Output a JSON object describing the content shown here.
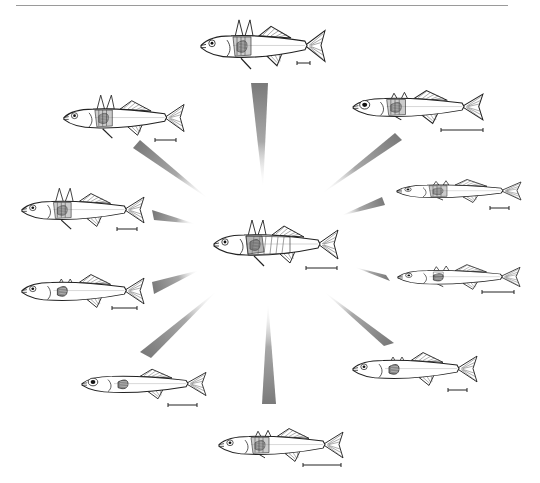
{
  "figure": {
    "type": "adaptive-radiation-diagram",
    "top_rule_color": "#9a9a9a",
    "wedge_color": "#7a7a7a",
    "line_color": "#222222"
  },
  "ancestor": {
    "name": "central-ancestral-fish",
    "x": 210,
    "y": 222,
    "w": 130,
    "h": 45,
    "spines": "long",
    "armor": "full",
    "eye": "small",
    "scale_bar": {
      "x1": 306,
      "x2": 337,
      "y": 268
    }
  },
  "fish": [
    {
      "name": "fish-top",
      "x": 197,
      "y": 22,
      "w": 130,
      "h": 48,
      "spines": "long",
      "armor": "partial",
      "eye": "small",
      "scale_bar": {
        "x1": 297,
        "x2": 310,
        "y": 63
      }
    },
    {
      "name": "fish-upper-left",
      "x": 60,
      "y": 97,
      "w": 126,
      "h": 42,
      "spines": "long",
      "armor": "partial",
      "eye": "small",
      "scale_bar": {
        "x1": 155,
        "x2": 176,
        "y": 140
      }
    },
    {
      "name": "fish-upper-right",
      "x": 349,
      "y": 87,
      "w": 136,
      "h": 40,
      "spines": "short",
      "armor": "partial",
      "eye": "large",
      "scale_bar": {
        "x1": 441,
        "x2": 483,
        "y": 130
      }
    },
    {
      "name": "fish-mid-left",
      "x": 18,
      "y": 190,
      "w": 128,
      "h": 40,
      "spines": "long",
      "armor": "partial",
      "eye": "small",
      "scale_bar": {
        "x1": 117,
        "x2": 137,
        "y": 229
      }
    },
    {
      "name": "fish-mid-right",
      "x": 393,
      "y": 177,
      "w": 130,
      "h": 28,
      "spines": "short",
      "armor": "partial",
      "eye": "small",
      "scale_bar": {
        "x1": 490,
        "x2": 509,
        "y": 208
      }
    },
    {
      "name": "fish-lower-left",
      "x": 18,
      "y": 271,
      "w": 128,
      "h": 40,
      "spines": "tiny",
      "armor": "none",
      "eye": "small",
      "scale_bar": {
        "x1": 112,
        "x2": 137,
        "y": 308
      }
    },
    {
      "name": "fish-lower-right",
      "x": 394,
      "y": 262,
      "w": 128,
      "h": 30,
      "spines": "short",
      "armor": "low",
      "eye": "small",
      "scale_bar": {
        "x1": 482,
        "x2": 514,
        "y": 292
      }
    },
    {
      "name": "fish-bottom-left",
      "x": 78,
      "y": 366,
      "w": 130,
      "h": 36,
      "spines": "none",
      "armor": "none",
      "eye": "large",
      "scale_bar": {
        "x1": 168,
        "x2": 197,
        "y": 405
      }
    },
    {
      "name": "fish-bottom-right",
      "x": 349,
      "y": 349,
      "w": 130,
      "h": 40,
      "spines": "tiny",
      "armor": "none",
      "eye": "small",
      "scale_bar": {
        "x1": 448,
        "x2": 467,
        "y": 390
      }
    },
    {
      "name": "fish-bottom",
      "x": 215,
      "y": 425,
      "w": 130,
      "h": 40,
      "spines": "short",
      "armor": "partial",
      "eye": "small",
      "scale_bar": {
        "x1": 303,
        "x2": 341,
        "y": 465
      }
    }
  ],
  "wedges": [
    {
      "name": "wedge-top",
      "tip": [
        263,
        190
      ],
      "base": [
        [
          251,
          83
        ],
        [
          268,
          83
        ]
      ]
    },
    {
      "name": "wedge-upper-left",
      "tip": [
        210,
        200
      ],
      "base": [
        [
          133,
          148
        ],
        [
          140,
          140
        ]
      ]
    },
    {
      "name": "wedge-upper-right",
      "tip": [
        320,
        195
      ],
      "base": [
        [
          395,
          133
        ],
        [
          402,
          140
        ]
      ]
    },
    {
      "name": "wedge-mid-left",
      "tip": [
        196,
        224
      ],
      "base": [
        [
          152,
          210
        ],
        [
          154,
          220
        ]
      ]
    },
    {
      "name": "wedge-mid-right",
      "tip": [
        340,
        216
      ],
      "base": [
        [
          382,
          197
        ],
        [
          385,
          205
        ]
      ]
    },
    {
      "name": "wedge-lower-left",
      "tip": [
        200,
        270
      ],
      "base": [
        [
          152,
          282
        ],
        [
          154,
          294
        ]
      ]
    },
    {
      "name": "wedge-lower-right",
      "tip": [
        354,
        267
      ],
      "base": [
        [
          386,
          275
        ],
        [
          390,
          281
        ]
      ]
    },
    {
      "name": "wedge-bottom-left",
      "tip": [
        218,
        290
      ],
      "base": [
        [
          140,
          352
        ],
        [
          151,
          358
        ]
      ]
    },
    {
      "name": "wedge-bottom-right",
      "tip": [
        322,
        290
      ],
      "base": [
        [
          384,
          346
        ],
        [
          394,
          343
        ]
      ]
    },
    {
      "name": "wedge-bottom",
      "tip": [
        268,
        300
      ],
      "base": [
        [
          262,
          404
        ],
        [
          276,
          404
        ]
      ]
    }
  ]
}
